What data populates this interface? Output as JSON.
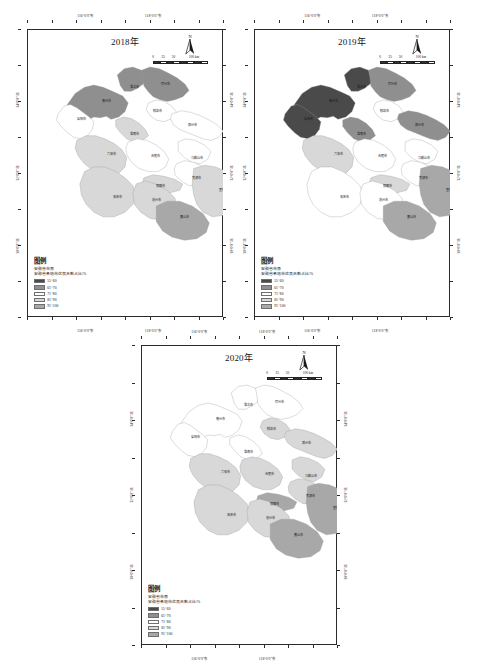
{
  "figure": {
    "background": "#ffffff",
    "panel_count": 3
  },
  "legend_common": {
    "title": "图例",
    "boundary_label": "安徽省市界",
    "variable_label": "安徽省各地市优良天数占比/%",
    "classes": [
      {
        "range": "55~60",
        "color": "#4a4a4a"
      },
      {
        "range": "61~70",
        "color": "#8f8f8f"
      },
      {
        "range": "71~80",
        "color": "#ffffff"
      },
      {
        "range": "81~90",
        "color": "#d8d8d8"
      },
      {
        "range": "91~100",
        "color": "#a8a8a8"
      }
    ]
  },
  "north_arrow": {
    "letter": "N"
  },
  "scale_bar": {
    "ticks": [
      "0",
      "25",
      "50",
      "100"
    ],
    "unit": "km"
  },
  "axes": {
    "lon_labels": [
      "116°0'0\"东",
      "118°0'0\"东"
    ],
    "lat_labels": [
      "34°0'0\"北",
      "32°0'0\"北",
      "30°0'0\"北"
    ]
  },
  "panels": [
    {
      "id": "panel-2018",
      "title": "2018年",
      "cities": [
        {
          "name": "淮北市",
          "class": 1,
          "x": 148,
          "y": 62
        },
        {
          "name": "宿州市",
          "class": 1,
          "x": 188,
          "y": 58
        },
        {
          "name": "亳州市",
          "class": 1,
          "x": 112,
          "y": 80
        },
        {
          "name": "蚌埠市",
          "class": 2,
          "x": 177,
          "y": 92
        },
        {
          "name": "阜阳市",
          "class": 2,
          "x": 80,
          "y": 103
        },
        {
          "name": "滁州市",
          "class": 2,
          "x": 222,
          "y": 110
        },
        {
          "name": "淮南市",
          "class": 3,
          "x": 148,
          "y": 122
        },
        {
          "name": "六安市",
          "class": 3,
          "x": 118,
          "y": 147
        },
        {
          "name": "合肥市",
          "class": 2,
          "x": 175,
          "y": 150
        },
        {
          "name": "马鞍山市",
          "class": 2,
          "x": 228,
          "y": 153
        },
        {
          "name": "芜湖市",
          "class": 2,
          "x": 228,
          "y": 178
        },
        {
          "name": "铜陵市",
          "class": 3,
          "x": 182,
          "y": 188
        },
        {
          "name": "宣城市",
          "class": 3,
          "x": 262,
          "y": 193
        },
        {
          "name": "安庆市",
          "class": 3,
          "x": 126,
          "y": 203
        },
        {
          "name": "池州市",
          "class": 3,
          "x": 176,
          "y": 207
        },
        {
          "name": "黄山市",
          "class": 4,
          "x": 212,
          "y": 228
        }
      ]
    },
    {
      "id": "panel-2019",
      "title": "2019年",
      "cities": [
        {
          "name": "淮北市",
          "class": 0,
          "x": 148,
          "y": 62
        },
        {
          "name": "宿州市",
          "class": 1,
          "x": 188,
          "y": 58
        },
        {
          "name": "亳州市",
          "class": 0,
          "x": 112,
          "y": 80
        },
        {
          "name": "蚌埠市",
          "class": 2,
          "x": 177,
          "y": 92
        },
        {
          "name": "阜阳市",
          "class": 0,
          "x": 80,
          "y": 103
        },
        {
          "name": "滁州市",
          "class": 1,
          "x": 222,
          "y": 110
        },
        {
          "name": "淮南市",
          "class": 1,
          "x": 148,
          "y": 122
        },
        {
          "name": "六安市",
          "class": 3,
          "x": 118,
          "y": 147
        },
        {
          "name": "合肥市",
          "class": 2,
          "x": 175,
          "y": 150
        },
        {
          "name": "马鞍山市",
          "class": 2,
          "x": 228,
          "y": 153
        },
        {
          "name": "芜湖市",
          "class": 2,
          "x": 228,
          "y": 178
        },
        {
          "name": "铜陵市",
          "class": 3,
          "x": 182,
          "y": 188
        },
        {
          "name": "宣城市",
          "class": 4,
          "x": 262,
          "y": 193
        },
        {
          "name": "安庆市",
          "class": 2,
          "x": 126,
          "y": 203
        },
        {
          "name": "池州市",
          "class": 2,
          "x": 176,
          "y": 207
        },
        {
          "name": "黄山市",
          "class": 4,
          "x": 212,
          "y": 228
        }
      ]
    },
    {
      "id": "panel-2020",
      "title": "2020年",
      "cities": [
        {
          "name": "淮北市",
          "class": 2,
          "x": 148,
          "y": 62
        },
        {
          "name": "宿州市",
          "class": 2,
          "x": 188,
          "y": 58
        },
        {
          "name": "亳州市",
          "class": 2,
          "x": 112,
          "y": 80
        },
        {
          "name": "蚌埠市",
          "class": 3,
          "x": 177,
          "y": 92
        },
        {
          "name": "阜阳市",
          "class": 2,
          "x": 80,
          "y": 103
        },
        {
          "name": "滁州市",
          "class": 3,
          "x": 222,
          "y": 110
        },
        {
          "name": "淮南市",
          "class": 2,
          "x": 148,
          "y": 122
        },
        {
          "name": "六安市",
          "class": 3,
          "x": 118,
          "y": 147
        },
        {
          "name": "合肥市",
          "class": 3,
          "x": 175,
          "y": 150
        },
        {
          "name": "马鞍山市",
          "class": 3,
          "x": 228,
          "y": 153
        },
        {
          "name": "芜湖市",
          "class": 3,
          "x": 228,
          "y": 178
        },
        {
          "name": "铜陵市",
          "class": 4,
          "x": 182,
          "y": 188
        },
        {
          "name": "宣城市",
          "class": 4,
          "x": 262,
          "y": 193
        },
        {
          "name": "安庆市",
          "class": 3,
          "x": 126,
          "y": 203
        },
        {
          "name": "池州市",
          "class": 3,
          "x": 176,
          "y": 207
        },
        {
          "name": "黄山市",
          "class": 4,
          "x": 212,
          "y": 228
        }
      ]
    }
  ],
  "chart_data": {
    "type": "heatmap",
    "title": "安徽省各地市优良天数占比/%",
    "subtitle": "2018年 / 2019年 / 2020年",
    "legend_position": "bottom-left",
    "class_bins": [
      "55~60",
      "61~70",
      "71~80",
      "81~90",
      "91~100"
    ],
    "categories": [
      "淮北市",
      "宿州市",
      "亳州市",
      "蚌埠市",
      "阜阳市",
      "滁州市",
      "淮南市",
      "六安市",
      "合肥市",
      "马鞍山市",
      "芜湖市",
      "铜陵市",
      "宣城市",
      "安庆市",
      "池州市",
      "黄山市"
    ],
    "series": [
      {
        "name": "2018年",
        "values": [
          "61~70",
          "61~70",
          "61~70",
          "71~80",
          "71~80",
          "71~80",
          "81~90",
          "81~90",
          "71~80",
          "71~80",
          "71~80",
          "81~90",
          "81~90",
          "81~90",
          "81~90",
          "91~100"
        ]
      },
      {
        "name": "2019年",
        "values": [
          "55~60",
          "61~70",
          "55~60",
          "71~80",
          "55~60",
          "61~70",
          "61~70",
          "81~90",
          "71~80",
          "71~80",
          "71~80",
          "81~90",
          "91~100",
          "71~80",
          "71~80",
          "91~100"
        ]
      },
      {
        "name": "2020年",
        "values": [
          "71~80",
          "71~80",
          "71~80",
          "81~90",
          "71~80",
          "81~90",
          "71~80",
          "81~90",
          "81~90",
          "81~90",
          "81~90",
          "91~100",
          "91~100",
          "81~90",
          "81~90",
          "91~100"
        ]
      }
    ],
    "xlabel": "经度",
    "ylabel": "纬度",
    "grid": false
  }
}
